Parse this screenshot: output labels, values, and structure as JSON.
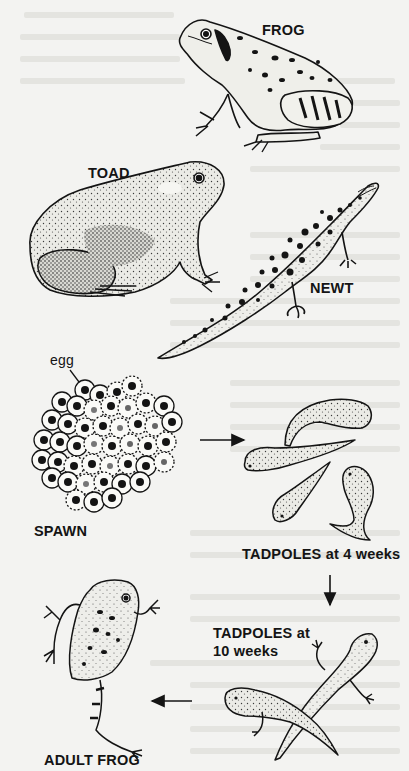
{
  "diagram": {
    "labels": {
      "frog": "FROG",
      "toad": "TOAD",
      "newt": "NEWT",
      "egg": "egg",
      "spawn": "SPAWN",
      "tadpoles_4": "TADPOLES at 4 weeks",
      "tadpoles_10_line1": "TADPOLES at",
      "tadpoles_10_line2": "10 weeks",
      "adult_frog": "ADULT FROG"
    },
    "illustrations": [
      {
        "id": "frog",
        "icon": "frog-icon"
      },
      {
        "id": "toad",
        "icon": "toad-icon"
      },
      {
        "id": "newt",
        "icon": "newt-icon"
      },
      {
        "id": "spawn",
        "icon": "frogspawn-icon"
      },
      {
        "id": "tadpoles-4-weeks",
        "icon": "tadpole-icon"
      },
      {
        "id": "tadpoles-10-weeks",
        "icon": "tadpole-with-legs-icon"
      },
      {
        "id": "adult-frog",
        "icon": "frog-icon"
      }
    ],
    "cycle_arrows": [
      {
        "from": "spawn",
        "to": "tadpoles-4-weeks",
        "direction": "right"
      },
      {
        "from": "tadpoles-4-weeks",
        "to": "tadpoles-10-weeks",
        "direction": "down"
      },
      {
        "from": "tadpoles-10-weeks",
        "to": "adult-frog",
        "direction": "left"
      }
    ],
    "colors": {
      "paper": "#f3f3f1",
      "ink": "#141414",
      "show_through_text": "#e4e4e0",
      "skin_fill": "#e9e9e4"
    }
  }
}
